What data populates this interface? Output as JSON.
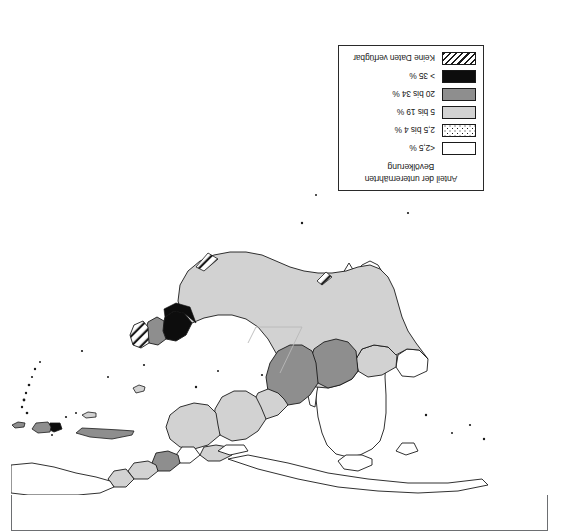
{
  "figure": {
    "orientation": "rotated-180",
    "background_color": "#ffffff",
    "frame_color": "#6d6f72"
  },
  "legend": {
    "title_line1": "Anteil der unterernährten",
    "title_line2": "Bevölkerung",
    "border_color": "#1a1a1a",
    "items": [
      {
        "label": "<2,5 %",
        "swatch": "white",
        "color": "#ffffff"
      },
      {
        "label": "2,5 bis 4 %",
        "swatch": "dotted",
        "color": "#ffffff"
      },
      {
        "label": "5 bis 19 %",
        "swatch": "light-gray",
        "color": "#d2d2d2"
      },
      {
        "label": "20 bis 34 %",
        "swatch": "dark-gray",
        "color": "#8e8e8e"
      },
      {
        "label": "> 35 %",
        "swatch": "black",
        "color": "#0d0d0d"
      },
      {
        "label": "Keine Daten verfügbar",
        "swatch": "hatched",
        "color": "#ffffff"
      }
    ]
  },
  "map": {
    "region": "South America and Caribbean",
    "land_outline_color": "#1a1a1a",
    "ocean_color": "#ffffff",
    "fills": {
      "white": "#ffffff",
      "light_gray": "#d2d2d2",
      "dark_gray": "#8e8e8e",
      "black": "#0d0d0d"
    },
    "areas": [
      {
        "name": "brazil",
        "class": "5 bis 19 %",
        "fill": "#d2d2d2"
      },
      {
        "name": "bolivia",
        "class": "20 bis 34 %",
        "fill": "#8e8e8e"
      },
      {
        "name": "peru",
        "class": "20 bis 34 %",
        "fill": "#8e8e8e"
      },
      {
        "name": "colombia",
        "class": "5 bis 19 %",
        "fill": "#d2d2d2"
      },
      {
        "name": "venezuela",
        "class": "5 bis 19 %",
        "fill": "#d2d2d2"
      },
      {
        "name": "ecuador",
        "class": "5 bis 19 %",
        "fill": "#d2d2d2"
      },
      {
        "name": "guyana",
        "class": "> 35 %",
        "fill": "#0d0d0d"
      },
      {
        "name": "suriname",
        "class": "5 bis 19 %",
        "fill": "#d2d2d2"
      },
      {
        "name": "french-guiana",
        "class": "Keine Daten verfügbar",
        "fill": "#ffffff"
      },
      {
        "name": "paraguay",
        "class": "5 bis 19 %",
        "fill": "#d2d2d2"
      },
      {
        "name": "argentina",
        "class": "<2,5 %",
        "fill": "#ffffff"
      },
      {
        "name": "chile",
        "class": "<2,5 %",
        "fill": "#ffffff"
      },
      {
        "name": "uruguay",
        "class": "<2,5 %",
        "fill": "#ffffff"
      },
      {
        "name": "panama",
        "class": "5 bis 19 %",
        "fill": "#d2d2d2"
      },
      {
        "name": "costa-rica",
        "class": "2,5 bis 4 %",
        "fill": "#ffffff"
      },
      {
        "name": "nicaragua",
        "class": "20 bis 34 %",
        "fill": "#8e8e8e"
      },
      {
        "name": "honduras",
        "class": "5 bis 19 %",
        "fill": "#d2d2d2"
      },
      {
        "name": "guatemala",
        "class": "5 bis 19 %",
        "fill": "#d2d2d2"
      },
      {
        "name": "mexico",
        "class": "2,5 bis 4 %",
        "fill": "#ffffff"
      },
      {
        "name": "cuba",
        "class": "5 bis 19 %",
        "fill": "#d2d2d2"
      },
      {
        "name": "haiti",
        "class": "> 35 %",
        "fill": "#0d0d0d"
      },
      {
        "name": "dominican-republic",
        "class": "5 bis 19 %",
        "fill": "#d2d2d2"
      }
    ]
  }
}
